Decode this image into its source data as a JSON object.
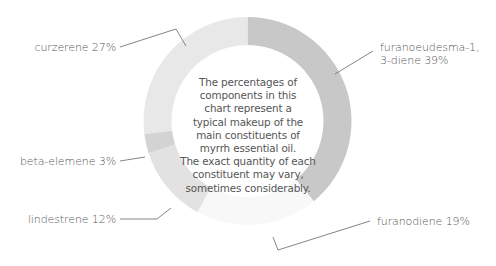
{
  "chart_data": {
    "type": "pie",
    "variant": "donut",
    "title": "",
    "categories": [
      "furanoeudesma-1, 3-diene",
      "furanodiene",
      "lindestrene",
      "beta-elemene",
      "curzerene"
    ],
    "values": [
      39,
      19,
      12,
      3,
      27
    ],
    "unit": "%",
    "colors": [
      "#c8c8c8",
      "#f8f8f8",
      "#e2e2e2",
      "#d3d3d3",
      "#e8e8e8"
    ],
    "start_angle_deg": 0,
    "direction": "clockwise",
    "legend": "none (leader-line labels)",
    "labels": [
      {
        "text_lines": [
          "furanoeudesma-1,",
          "3-diene 39%"
        ],
        "x": 380,
        "y": 41,
        "align": "left"
      },
      {
        "text_lines": [
          "furanodiene 19%"
        ],
        "x": 377,
        "y": 215,
        "align": "left"
      },
      {
        "text_lines": [
          "lindestrene 12%"
        ],
        "x": 116,
        "y": 213,
        "align": "right"
      },
      {
        "text_lines": [
          "beta-elemene 3%"
        ],
        "x": 116,
        "y": 155,
        "align": "right"
      },
      {
        "text_lines": [
          "curzerene 27%"
        ],
        "x": 116,
        "y": 41,
        "align": "right"
      }
    ],
    "leader_lines": [
      [
        [
          335,
          74
        ],
        [
          373,
          51
        ]
      ],
      [
        [
          273,
          237
        ],
        [
          278,
          250
        ],
        [
          370,
          221
        ]
      ],
      [
        [
          171,
          208
        ],
        [
          157,
          219
        ],
        [
          120,
          219
        ]
      ],
      [
        [
          145,
          157
        ],
        [
          120,
          161
        ]
      ],
      [
        [
          186,
          46
        ],
        [
          176,
          29
        ],
        [
          120,
          47
        ]
      ]
    ],
    "annotation": [
      "The percentages of",
      "components in this",
      "chart represent a",
      "typical makeup of the",
      "main constituents of",
      "myrrh essential oil.",
      "The exact quantity of each",
      "constituent may vary,",
      "sometimes considerably."
    ],
    "geometry": {
      "cx": 247.5,
      "cy": 121,
      "outer_r": 104,
      "inner_r": 76
    }
  },
  "annotation_lines": [
    "The percentages of",
    "components in this",
    "chart represent a",
    "typical makeup of the",
    "main constituents of",
    "myrrh essential oil.",
    "The exact quantity of each",
    "constituent may vary,",
    "sometimes considerably."
  ],
  "labels": {
    "furanoeudesma_line1": "furanoeudesma-1,",
    "furanoeudesma_line2": "3-diene 39%",
    "furanodiene": "furanodiene 19%",
    "lindestrene": "lindestrene 12%",
    "beta_elemene": "beta-elemene 3%",
    "curzerene": "curzerene 27%"
  }
}
